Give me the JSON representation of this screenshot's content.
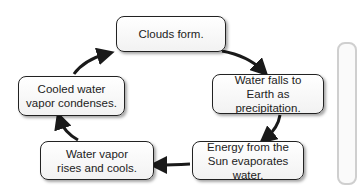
{
  "diagram": {
    "nodes": [
      {
        "id": "clouds",
        "label": "Clouds form."
      },
      {
        "id": "precip",
        "label": "Water falls to Earth as precipitation.",
        "line1": "Water falls to",
        "line2": "Earth as precipitation."
      },
      {
        "id": "evap",
        "label": "Energy from the Sun evaporates water.",
        "line1": "Energy from the",
        "line2": "Sun evaporates water."
      },
      {
        "id": "rises",
        "label": "Water vapor rises and cools.",
        "line1": "Water vapor",
        "line2": "rises and cools."
      },
      {
        "id": "condense",
        "label": "Cooled water vapor condenses.",
        "line1": "Cooled water",
        "line2": "vapor condenses."
      }
    ],
    "edges": [
      {
        "from": "clouds",
        "to": "precip"
      },
      {
        "from": "precip",
        "to": "evap"
      },
      {
        "from": "evap",
        "to": "rises"
      },
      {
        "from": "rises",
        "to": "condense"
      },
      {
        "from": "condense",
        "to": "clouds"
      }
    ],
    "colors": {
      "border": "#222222",
      "arrow": "#1a1a1a",
      "fill": "#ffffff"
    }
  }
}
